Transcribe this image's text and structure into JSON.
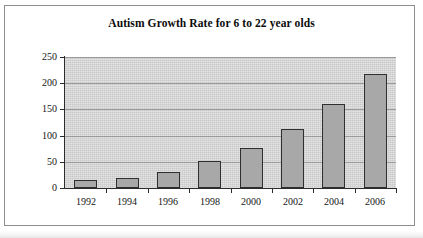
{
  "chart_data": {
    "type": "bar",
    "title": "Autism Growth Rate for 6 to 22 year olds",
    "xlabel": "",
    "ylabel": "Thousands",
    "categories": [
      "1992",
      "1994",
      "1996",
      "1998",
      "2000",
      "2002",
      "2004",
      "2006"
    ],
    "values": [
      15,
      20,
      30,
      52,
      77,
      113,
      161,
      217
    ],
    "ylim": [
      0,
      250
    ],
    "ytick_labels": [
      "0",
      "50",
      "100",
      "150",
      "200",
      "250"
    ],
    "ytick_values": [
      0,
      50,
      100,
      150,
      200,
      250
    ],
    "grid": "horizontal",
    "legend": "none",
    "series": [
      {
        "name": "Autism cases",
        "values": [
          15,
          20,
          30,
          52,
          77,
          113,
          161,
          217
        ]
      }
    ],
    "colors": {
      "bar_fill": "#a8a8a8",
      "bar_border": "#2e2e2e",
      "plot_background": "#c9c9c9",
      "gridline": "#9a9a9a",
      "axis": "#2b2b2b",
      "text": "#141414",
      "page_background": "#ffffff",
      "frame_border": "#8d8d8d"
    }
  }
}
